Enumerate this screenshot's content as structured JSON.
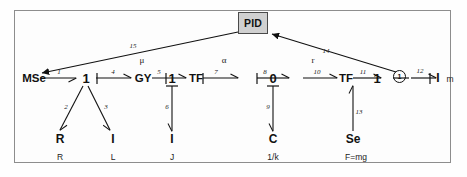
{
  "diagram": {
    "type": "bond-graph",
    "title_visible": false,
    "frame": {
      "border_color": "#8d8d8d",
      "background": "#fdfdfd"
    }
  },
  "controller": {
    "label": "PID",
    "fill": "#d0d0d0",
    "stroke": "#4a4a4a"
  },
  "nodes": {
    "mse": "MSe",
    "junction1_a": "1",
    "gyrator": "GY",
    "junction1_b": "1",
    "transformer_a": "TF",
    "junction0": "0",
    "transformer_b": "TF",
    "junction1_c": "1",
    "summer": "1",
    "inertia_right": "I",
    "inertia_right_param": "m"
  },
  "elements": [
    {
      "name": "R",
      "param": "R"
    },
    {
      "name": "I",
      "param": "L"
    },
    {
      "name": "I",
      "param": "J"
    },
    {
      "name": "C",
      "param": "1/k"
    },
    {
      "name": "Se",
      "param": "F=mg"
    }
  ],
  "gains": {
    "gyrator_modulus": "μ",
    "transformer_a_modulus": "α",
    "transformer_b_modulus": "r"
  },
  "bonds": [
    {
      "id": "1",
      "from": "junction1_a",
      "to": "mse"
    },
    {
      "id": "2",
      "from": "junction1_a",
      "to": "R"
    },
    {
      "id": "3",
      "from": "junction1_a",
      "to": "I_L"
    },
    {
      "id": "4",
      "from": "junction1_a",
      "to": "gyrator"
    },
    {
      "id": "5",
      "from": "gyrator",
      "to": "junction1_b"
    },
    {
      "id": "6",
      "from": "junction1_b",
      "to": "I_J"
    },
    {
      "id": "7",
      "from": "junction1_b",
      "to": "transformer_a"
    },
    {
      "id": "8",
      "from": "transformer_a",
      "to": "junction0"
    },
    {
      "id": "9",
      "from": "junction0",
      "to": "C"
    },
    {
      "id": "10",
      "from": "junction0",
      "to": "transformer_b"
    },
    {
      "id": "11",
      "from": "transformer_b",
      "to": "junction1_c"
    },
    {
      "id": "12",
      "from": "summer",
      "to": "inertia_right"
    },
    {
      "id": "13",
      "from": "Se",
      "to": "junction1_c"
    },
    {
      "id": "14",
      "from": "summer",
      "to": "PID"
    },
    {
      "id": "15",
      "from": "PID",
      "to": "mse"
    }
  ]
}
